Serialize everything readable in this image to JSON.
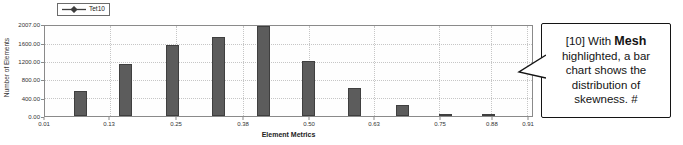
{
  "colors": {
    "bar_fill": "#5c5c5c",
    "bar_border": "#3f3f3f",
    "grid": "#c6c6c6",
    "frame": "#8a8a8a",
    "callout_border": "#141414"
  },
  "chart": {
    "legend": {
      "label": "Tet10"
    },
    "y_axis": {
      "title": "Number of Elements",
      "ticks": [
        {
          "label": "2007.00",
          "value": 2007
        },
        {
          "label": "1600.00",
          "value": 1600
        },
        {
          "label": "1200.00",
          "value": 1200
        },
        {
          "label": "800.00",
          "value": 800
        },
        {
          "label": "400.00",
          "value": 400
        },
        {
          "label": "0.00",
          "value": 0
        }
      ]
    },
    "x_axis": {
      "title": "Element Metrics",
      "ticks": [
        {
          "label": "0.01",
          "pct": 0
        },
        {
          "label": "0.13",
          "pct": 13.3
        },
        {
          "label": "0.25",
          "pct": 27.0
        },
        {
          "label": "0.38",
          "pct": 40.7
        },
        {
          "label": "0.50",
          "pct": 54.2
        },
        {
          "label": "0.63",
          "pct": 67.5
        },
        {
          "label": "0.75",
          "pct": 81.0
        },
        {
          "label": "0.88",
          "pct": 91.6
        },
        {
          "label": "0.91",
          "pct": 99.0
        }
      ]
    }
  },
  "chart_data": {
    "type": "bar",
    "title": "",
    "xlabel": "Element Metrics",
    "ylabel": "Number of Elements",
    "xlim": [
      0.01,
      0.91
    ],
    "ylim": [
      0,
      2007
    ],
    "grid": true,
    "legend_position": "top-left",
    "x": [
      0.07,
      0.16,
      0.25,
      0.33,
      0.41,
      0.5,
      0.58,
      0.67,
      0.75,
      0.83
    ],
    "series": [
      {
        "name": "Tet10",
        "values": [
          560,
          1160,
          1580,
          1760,
          2007,
          1225,
          625,
          245,
          55,
          35
        ]
      }
    ],
    "bar_centers_pct": [
      7.3,
      16.6,
      26.2,
      35.6,
      44.8,
      54.2,
      63.6,
      73.4,
      82.2,
      91.0
    ]
  },
  "callout": {
    "prefix": "[10] With ",
    "bold_text": "Mesh",
    "rest": " highlighted, a bar chart shows the distribution of skewness.  #"
  }
}
